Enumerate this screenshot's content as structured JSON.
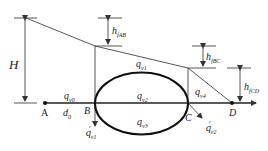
{
  "diagram": {
    "type": "hydraulic-energy-grade-line with parallel pipe loop",
    "points": [
      {
        "id": "A",
        "label": "A"
      },
      {
        "id": "B",
        "label": "B"
      },
      {
        "id": "C",
        "label": "C"
      },
      {
        "id": "D",
        "label": "D"
      }
    ],
    "heights": {
      "H": "H",
      "h_fAB": {
        "base": "h",
        "sub": "fAB"
      },
      "h_fBC": {
        "base": "h",
        "sub": "fBC"
      },
      "h_fCD": {
        "base": "h",
        "sub": "fCD"
      }
    },
    "flows": {
      "q_v0": {
        "base": "q",
        "sub": "v0"
      },
      "q_v1": {
        "base": "q",
        "sub": "v1"
      },
      "q_v2": {
        "base": "q",
        "sub": "v2"
      },
      "q_v3": {
        "base": "q",
        "sub": "v3"
      },
      "q_v4": {
        "base": "q",
        "sub": "v4"
      },
      "q_prime_v1": {
        "base": "q",
        "prime": "′",
        "sub": "v1"
      },
      "q_prime_v2": {
        "base": "q",
        "prime": "′",
        "sub": "v2"
      }
    },
    "diameter": {
      "base": "d",
      "sub": "0"
    },
    "colors": {
      "line": "#333333",
      "background": "#ffffff"
    }
  }
}
